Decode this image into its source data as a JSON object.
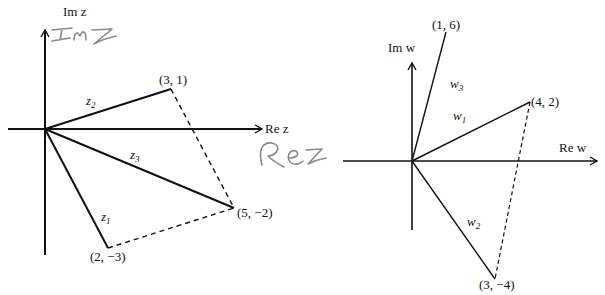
{
  "left_plot": {
    "axis_x_label": "Re z",
    "axis_y_label": "Im z",
    "handwritten_y": "ImZ",
    "handwritten_x": "ReZ",
    "vectors": [
      {
        "name": "z1",
        "label_base": "z",
        "label_sub": "1",
        "point": "(2, −3)",
        "re": 2,
        "im": -3
      },
      {
        "name": "z2",
        "label_base": "z",
        "label_sub": "2",
        "point": "(3, 1)",
        "re": 3,
        "im": 1
      },
      {
        "name": "z3",
        "label_base": "z",
        "label_sub": "3",
        "point": "(5, −2)",
        "re": 5,
        "im": -2
      }
    ],
    "dashed_edges": [
      [
        "(3, 1)",
        "(5, −2)"
      ],
      [
        "(2, −3)",
        "(5, −2)"
      ]
    ]
  },
  "right_plot": {
    "axis_x_label": "Re w",
    "axis_y_label": "Im w",
    "vectors": [
      {
        "name": "w1",
        "label_base": "w",
        "label_sub": "1",
        "point": "(4, 2)",
        "re": 4,
        "im": 2
      },
      {
        "name": "w2",
        "label_base": "w",
        "label_sub": "2",
        "point": "(3, −4)",
        "re": 3,
        "im": -4
      },
      {
        "name": "w3",
        "label_base": "w",
        "label_sub": "3",
        "point": "(1, 6)",
        "re": 1,
        "im": 6
      }
    ],
    "dashed_edges": [
      [
        "(4, 2)",
        "(3, −4)"
      ]
    ]
  },
  "colors": {
    "ink": "#111111",
    "handwriting": "#8a8a8a",
    "background": "#ffffff"
  }
}
